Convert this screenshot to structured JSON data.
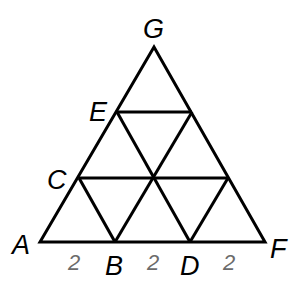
{
  "diagram": {
    "points": {
      "A": "A",
      "B": "B",
      "C": "C",
      "D": "D",
      "E": "E",
      "F": "F",
      "G": "G"
    },
    "segment_lengths": {
      "AB": "2",
      "BD": "2",
      "DF": "2"
    },
    "colors": {
      "lines": "#000000",
      "length_labels": "#6b6b6b"
    }
  }
}
